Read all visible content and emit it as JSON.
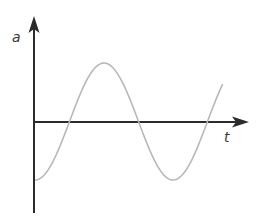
{
  "diagram": {
    "y_axis_label": "a",
    "x_axis_label": "t",
    "colors": {
      "axis": "#2b2b2b",
      "curve": "#b8b8b8",
      "label": "#3a3a3a"
    }
  },
  "chart_data": {
    "type": "line",
    "title": "",
    "xlabel": "t",
    "ylabel": "a",
    "function": "a = -A cos(ωt)",
    "points": [
      {
        "t": 0.0,
        "a": -1.0
      },
      {
        "t": 0.25,
        "a": 0.0
      },
      {
        "t": 0.5,
        "a": 1.0
      },
      {
        "t": 0.75,
        "a": 0.0
      },
      {
        "t": 1.0,
        "a": -1.0
      },
      {
        "t": 1.25,
        "a": 0.0
      },
      {
        "t": 1.36,
        "a": 0.7
      }
    ],
    "xlim": [
      0,
      1.55
    ],
    "ylim": [
      -1.6,
      1.8
    ],
    "grid": false,
    "legend": null
  }
}
